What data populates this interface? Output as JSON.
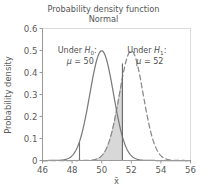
{
  "chart_data": {
    "type": "line",
    "title": "Probability density function",
    "subtitle": "Normal",
    "xlabel": "x̄",
    "ylabel": "Probability density",
    "xlim": [
      46,
      56
    ],
    "ylim": [
      0,
      0.6
    ],
    "xticks": [
      "46",
      "48",
      "50",
      "52",
      "54",
      "56"
    ],
    "xtick_values": [
      46,
      48,
      50,
      52,
      54,
      56
    ],
    "yticks": [
      "0.0",
      "0.1",
      "0.2",
      "0.3",
      "0.4",
      "0.5",
      "0.6"
    ],
    "ytick_values": [
      0.0,
      0.1,
      0.2,
      0.3,
      0.4,
      0.5,
      0.6
    ],
    "ytick_display": [
      "0",
      "0.1",
      "0.2",
      "0.3",
      "0.4",
      "0.5",
      "0.6"
    ],
    "grid": false,
    "legend": "none",
    "series": [
      {
        "name": "Under H0",
        "style": "solid",
        "color": "#7b7b7b",
        "distribution": "normal",
        "mean": 50,
        "sigma": 0.8,
        "peak": 0.4986,
        "x": [
          46.0,
          46.5,
          47.0,
          47.5,
          48.0,
          48.5,
          49.0,
          49.5,
          50.0,
          50.5,
          51.0,
          51.5,
          52.0,
          52.5,
          53.0,
          53.5,
          54.0,
          54.5,
          55.0,
          55.5,
          56.0
        ],
        "y": [
          0.0,
          0.0001,
          0.0004,
          0.0022,
          0.0088,
          0.0277,
          0.0691,
          0.1376,
          0.4986,
          0.3604,
          0.1376,
          0.0277,
          0.0088,
          0.0022,
          0.0004,
          0.0001,
          0.0,
          0.0,
          0.0,
          0.0,
          0.0
        ]
      },
      {
        "name": "Under H1",
        "style": "dashed",
        "color": "#8a8a8a",
        "distribution": "normal",
        "mean": 52,
        "sigma": 0.8,
        "peak": 0.4986,
        "x": [
          48.0,
          48.5,
          49.0,
          49.5,
          50.0,
          50.5,
          51.0,
          51.5,
          52.0,
          52.5,
          53.0,
          53.5,
          54.0,
          54.5,
          55.0,
          55.5,
          56.0
        ],
        "y": [
          0.0,
          0.0001,
          0.0004,
          0.0022,
          0.0088,
          0.0277,
          0.1376,
          0.3604,
          0.4986,
          0.3604,
          0.1376,
          0.0277,
          0.0088,
          0.0022,
          0.0004,
          0.0001,
          0.0
        ]
      }
    ],
    "shaded_region": {
      "label": "beta-region",
      "color": "#d8d8d8",
      "edge_color": "#9a9a9a",
      "under_series": "Under H1",
      "x_from": 49.6,
      "x_to": 51.4
    },
    "vlines": [
      {
        "name": "lower-critical-line",
        "x": 48.5,
        "y_top": 0.082,
        "color": "#707070"
      },
      {
        "name": "upper-critical-line",
        "x": 51.4,
        "y_top": 0.441,
        "color": "#6b6b6b"
      }
    ],
    "annotations": [
      {
        "name": "h0-annotation",
        "line1_pre": "Under ",
        "line1_sym": "H",
        "line1_subscript": "0",
        "line1_post": ":",
        "line2_sym": "μ",
        "line2_post": " = 50",
        "x": 48.35,
        "y": 0.487
      },
      {
        "name": "h1-annotation",
        "line1_pre": "Under ",
        "line1_sym": "H",
        "line1_subscript": "1",
        "line1_post": ":",
        "line2_sym": "μ",
        "line2_post": " = 52",
        "x": 53.05,
        "y": 0.487
      }
    ]
  },
  "colors": {
    "background": "#ffffff",
    "frame": "#d6d6d6",
    "axis": "#8d8d8d",
    "text": "#545454",
    "curve_solid": "#7b7b7b",
    "curve_dashed": "#8a8a8a",
    "shade_fill": "#d8d8d8"
  }
}
